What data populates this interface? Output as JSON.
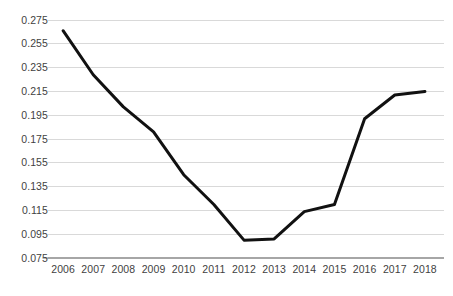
{
  "chart_data": {
    "type": "line",
    "title": "",
    "xlabel": "",
    "ylabel": "",
    "categories": [
      "2006",
      "2007",
      "2008",
      "2009",
      "2010",
      "2011",
      "2012",
      "2013",
      "2014",
      "2015",
      "2016",
      "2017",
      "2018"
    ],
    "values": [
      0.266,
      0.229,
      0.202,
      0.181,
      0.145,
      0.12,
      0.09,
      0.091,
      0.114,
      0.12,
      0.192,
      0.212,
      0.215
    ],
    "series": [
      {
        "name": "",
        "values": [
          0.266,
          0.229,
          0.202,
          0.181,
          0.145,
          0.12,
          0.09,
          0.091,
          0.114,
          0.12,
          0.192,
          0.212,
          0.215
        ]
      }
    ],
    "ylim": [
      0.075,
      0.275
    ],
    "yticks": [
      0.075,
      0.095,
      0.115,
      0.135,
      0.155,
      0.175,
      0.195,
      0.215,
      0.235,
      0.255,
      0.275
    ],
    "ytick_labels": [
      "0.075",
      "0.095",
      "0.115",
      "0.135",
      "0.155",
      "0.175",
      "0.195",
      "0.215",
      "0.235",
      "0.255",
      "0.275"
    ],
    "xtick_labels": [
      "2006",
      "2007",
      "2008",
      "2009",
      "2010",
      "2011",
      "2012",
      "2013",
      "2014",
      "2015",
      "2016",
      "2017",
      "2018"
    ],
    "grid": true,
    "grid_axis": "y",
    "legend": false,
    "legend_position": "none",
    "line_color": "#111111",
    "line_width": 3,
    "markers": false,
    "gridline_color": "#d9d9d9",
    "axis_color": "#a6a6a6",
    "tick_label_color": "#3f3f3f",
    "background_color": "#ffffff"
  },
  "axis": {
    "y_label_0": "0.275",
    "y_label_1": "0.255",
    "y_label_2": "0.235",
    "y_label_3": "0.215",
    "y_label_4": "0.195",
    "y_label_5": "0.175",
    "y_label_6": "0.155",
    "y_label_7": "0.135",
    "y_label_8": "0.115",
    "y_label_9": "0.095",
    "y_label_10": "0.075",
    "x_label_0": "2006",
    "x_label_1": "2007",
    "x_label_2": "2008",
    "x_label_3": "2009",
    "x_label_4": "2010",
    "x_label_5": "2011",
    "x_label_6": "2012",
    "x_label_7": "2013",
    "x_label_8": "2014",
    "x_label_9": "2015",
    "x_label_10": "2016",
    "x_label_11": "2017",
    "x_label_12": "2018"
  }
}
